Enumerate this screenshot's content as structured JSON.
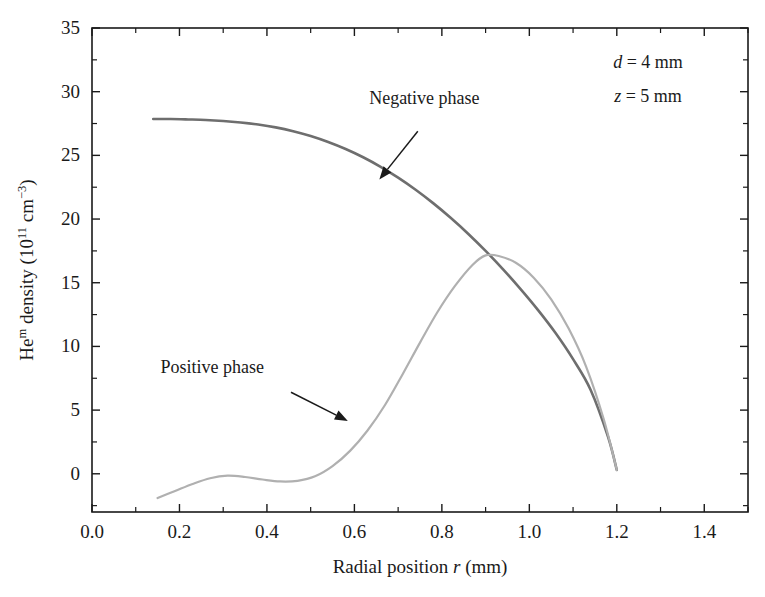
{
  "chart_data": {
    "type": "line",
    "title": "",
    "xlabel": "Radial position r (mm)",
    "ylabel": "Heᵐ density (10¹¹ cm⁻³)",
    "xlabel_parts": {
      "pre": "Radial position ",
      "italic": "r",
      "post": " (mm)"
    },
    "ylabel_parts": {
      "pre": "He",
      "sup1": "m",
      "mid": " density (10",
      "sup2": "11",
      "mid2": " cm",
      "sup3": "−3",
      "post": ")"
    },
    "xlim": [
      0.0,
      1.5
    ],
    "ylim": [
      -3,
      35
    ],
    "x_ticks": [
      0.0,
      0.2,
      0.4,
      0.6,
      0.8,
      1.0,
      1.2,
      1.4
    ],
    "x_tick_labels": [
      "0.0",
      "0.2",
      "0.4",
      "0.6",
      "0.8",
      "1.0",
      "1.2",
      "1.4"
    ],
    "x_minor_step": 0.1,
    "y_ticks": [
      0,
      5,
      10,
      15,
      20,
      25,
      30,
      35
    ],
    "y_tick_labels": [
      "0",
      "5",
      "10",
      "15",
      "20",
      "25",
      "30",
      "35"
    ],
    "y_minor_step": 2.5,
    "grid": false,
    "legend_position": "none",
    "frame": "box",
    "series": [
      {
        "name": "Negative phase",
        "color": "#6e6e6e",
        "width": 2.6,
        "x": [
          0.14,
          0.18,
          0.22,
          0.26,
          0.3,
          0.34,
          0.38,
          0.42,
          0.46,
          0.5,
          0.54,
          0.58,
          0.62,
          0.66,
          0.7,
          0.74,
          0.78,
          0.82,
          0.86,
          0.9,
          0.94,
          0.98,
          1.02,
          1.06,
          1.1,
          1.14,
          1.18,
          1.2
        ],
        "y": [
          27.85,
          27.85,
          27.82,
          27.78,
          27.7,
          27.58,
          27.42,
          27.2,
          26.9,
          26.52,
          26.05,
          25.5,
          24.85,
          24.1,
          23.25,
          22.3,
          21.25,
          20.1,
          18.85,
          17.5,
          16.05,
          14.5,
          12.85,
          11.05,
          9.0,
          6.6,
          2.9,
          0.3
        ]
      },
      {
        "name": "Positive phase",
        "color": "#b0b0b0",
        "width": 2.2,
        "x": [
          0.15,
          0.19,
          0.23,
          0.27,
          0.31,
          0.35,
          0.39,
          0.43,
          0.47,
          0.51,
          0.55,
          0.59,
          0.63,
          0.67,
          0.71,
          0.75,
          0.79,
          0.83,
          0.87,
          0.9,
          0.93,
          0.97,
          1.01,
          1.05,
          1.09,
          1.13,
          1.17,
          1.2
        ],
        "y": [
          -1.9,
          -1.35,
          -0.8,
          -0.35,
          -0.15,
          -0.25,
          -0.45,
          -0.6,
          -0.55,
          -0.2,
          0.6,
          1.8,
          3.4,
          5.4,
          7.8,
          10.3,
          12.7,
          14.75,
          16.4,
          17.15,
          17.1,
          16.55,
          15.4,
          13.7,
          11.4,
          8.4,
          4.3,
          0.3
        ]
      }
    ],
    "annotations": [
      {
        "id": "negative-phase-annotation",
        "label": "Negative phase",
        "text_x": 0.76,
        "text_y": 29.0,
        "arrow_from": [
          0.745,
          26.9
        ],
        "arrow_to": [
          0.657,
          23.1
        ]
      },
      {
        "id": "positive-phase-annotation",
        "label": "Positive phase",
        "text_x": 0.275,
        "text_y": 7.9,
        "arrow_from": [
          0.455,
          6.4
        ],
        "arrow_to": [
          0.585,
          4.15
        ]
      }
    ],
    "parameters": [
      {
        "id": "d-parameter",
        "symbol": "d",
        "relation": "=",
        "value": "4",
        "unit": "mm",
        "text": "d = 4 mm"
      },
      {
        "id": "z-parameter",
        "symbol": "z",
        "relation": "=",
        "value": "5",
        "unit": "mm",
        "text": "z = 5 mm"
      }
    ]
  },
  "colors": {
    "axis": "#1a1a1a",
    "negative_phase": "#6e6e6e",
    "positive_phase": "#b0b0b0",
    "background": "#ffffff",
    "text": "#1a1a1a"
  }
}
